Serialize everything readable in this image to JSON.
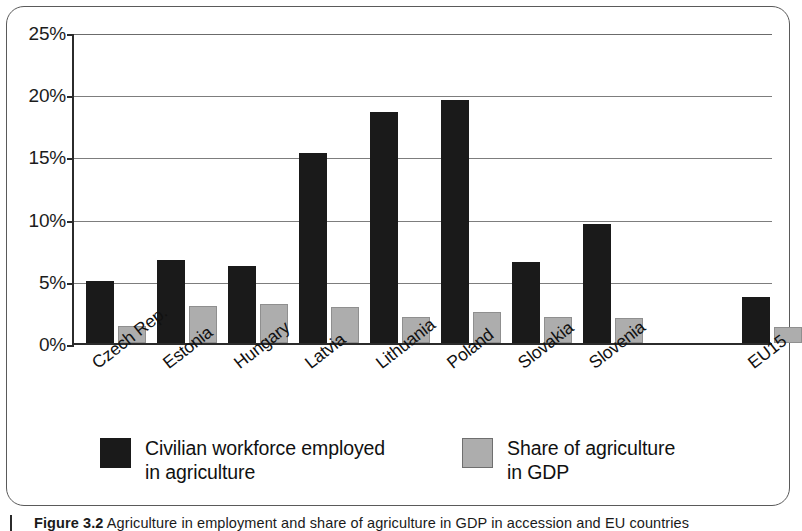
{
  "figure": {
    "caption_prefix": "Figure 3.2",
    "caption_text": "Agriculture in employment and share of agriculture in GDP in accession and EU countries"
  },
  "chart_data": {
    "type": "bar",
    "title": "",
    "xlabel": "",
    "ylabel": "",
    "ylim": [
      0,
      25
    ],
    "yunit": "%",
    "grid": true,
    "legend_position": "bottom",
    "tick_labels": [
      "0%",
      "5%",
      "10%",
      "15%",
      "20%",
      "25%"
    ],
    "tick_values": [
      0,
      5,
      10,
      15,
      20,
      25
    ],
    "categories": [
      "Czech Rep.",
      "Estonia",
      "Hungary",
      "Latvia",
      "Lithuania",
      "Poland",
      "Slovakia",
      "Slovenia",
      "EU15"
    ],
    "series": [
      {
        "name": "Civilian workforce employed in agriculture",
        "color": "#1a1a1a",
        "values": [
          5.0,
          6.7,
          6.2,
          15.3,
          18.6,
          19.5,
          6.5,
          9.6,
          3.7
        ]
      },
      {
        "name": "Share of agriculture in GDP",
        "color": "#adadad",
        "values": [
          1.4,
          3.0,
          3.1,
          2.9,
          2.1,
          2.5,
          2.1,
          2.0,
          1.3
        ]
      }
    ]
  },
  "legend": {
    "entries": [
      {
        "label_line1": "Civilian workforce employed",
        "label_line2": "in agriculture",
        "swatch": "dark-swatch"
      },
      {
        "label_line1": "Share of agriculture",
        "label_line2": "in GDP",
        "swatch": "light-swatch"
      }
    ]
  }
}
